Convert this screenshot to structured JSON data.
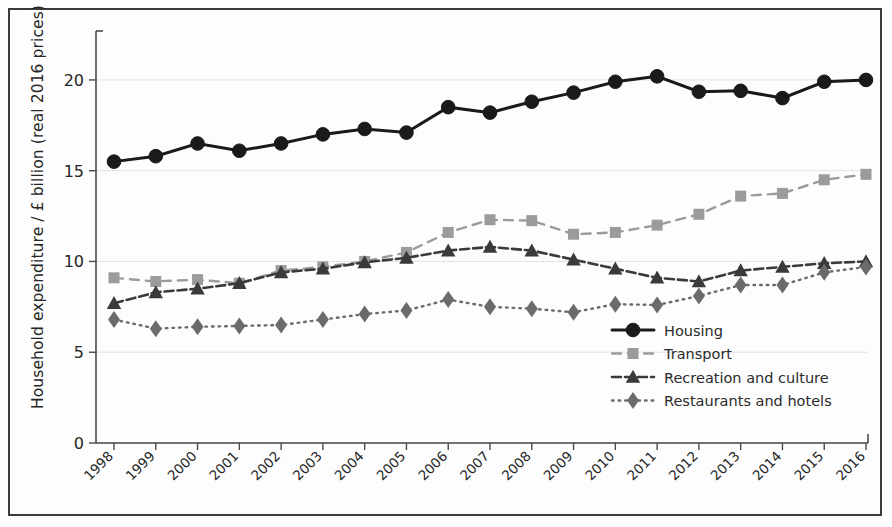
{
  "chart_data": {
    "type": "line",
    "title": "",
    "xlabel": "",
    "ylabel": "Household expenditure / £ billion (real 2016 prices)",
    "categories": [
      "1998",
      "1999",
      "2000",
      "2001",
      "2002",
      "2003",
      "2004",
      "2005",
      "2006",
      "2007",
      "2008",
      "2009",
      "2010",
      "2011",
      "2012",
      "2013",
      "2014",
      "2015",
      "2016"
    ],
    "x": [
      1998,
      1999,
      2000,
      2001,
      2002,
      2003,
      2004,
      2005,
      2006,
      2007,
      2008,
      2009,
      2010,
      2011,
      2012,
      2013,
      2014,
      2015,
      2016
    ],
    "ylim": [
      0,
      22.2
    ],
    "xlim": [
      1997.5,
      2016.5
    ],
    "yticks": [
      0,
      5,
      10,
      15,
      20
    ],
    "ytick_labels": [
      "0",
      "5",
      "10",
      "15",
      "20"
    ],
    "grid": "horizontal",
    "legend_position": "lower right inside plot",
    "series": [
      {
        "name": "Housing",
        "color": "#1a1a1a",
        "marker": "circle",
        "linestyle": "solid",
        "values": [
          15.5,
          15.8,
          16.5,
          16.1,
          16.5,
          17.0,
          17.3,
          17.1,
          18.5,
          18.2,
          18.8,
          19.3,
          19.9,
          20.2,
          19.35,
          19.4,
          19.0,
          19.9,
          20.0
        ]
      },
      {
        "name": "Transport",
        "color": "#9b9b9b",
        "marker": "square",
        "linestyle": "dashed",
        "values": [
          9.1,
          8.9,
          9.0,
          8.8,
          9.5,
          9.7,
          10.0,
          10.5,
          11.6,
          12.3,
          12.25,
          11.5,
          11.6,
          12.0,
          12.6,
          13.6,
          13.75,
          14.5,
          14.8
        ]
      },
      {
        "name": "Recreation and culture",
        "color": "#3a3a3a",
        "marker": "triangle",
        "linestyle": "dashdot",
        "values": [
          7.7,
          8.3,
          8.5,
          8.8,
          9.4,
          9.6,
          9.95,
          10.2,
          10.6,
          10.8,
          10.6,
          10.1,
          9.6,
          9.1,
          8.9,
          9.5,
          9.7,
          9.9,
          10.0
        ]
      },
      {
        "name": "Restaurants and hotels",
        "color": "#6b6b6b",
        "marker": "diamond",
        "linestyle": "dotted",
        "values": [
          6.8,
          6.3,
          6.4,
          6.45,
          6.5,
          6.8,
          7.1,
          7.3,
          7.9,
          7.5,
          7.4,
          7.2,
          7.65,
          7.6,
          8.1,
          8.7,
          8.7,
          9.4,
          9.7
        ]
      }
    ]
  },
  "legend": {
    "items": [
      {
        "label": "Housing"
      },
      {
        "label": "Transport"
      },
      {
        "label": "Recreation and culture"
      },
      {
        "label": "Restaurants and hotels"
      }
    ]
  }
}
